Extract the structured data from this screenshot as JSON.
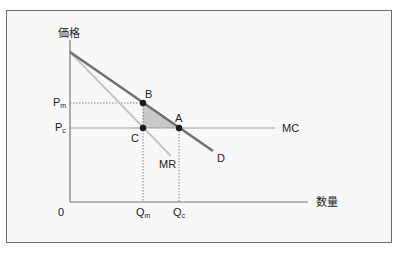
{
  "diagram": {
    "y_axis_label": "価格",
    "x_axis_label": "数量",
    "origin_label": "0",
    "price_labels": {
      "monopoly": {
        "main": "P",
        "sub": "m"
      },
      "competitive": {
        "main": "P",
        "sub": "c"
      }
    },
    "quantity_labels": {
      "monopoly": {
        "main": "Q",
        "sub": "m"
      },
      "competitive": {
        "main": "Q",
        "sub": "c"
      }
    },
    "curves": {
      "demand": "D",
      "marginal_revenue": "MR",
      "marginal_cost": "MC"
    },
    "points": {
      "A": "A",
      "B": "B",
      "C": "C"
    },
    "colors": {
      "demand": "#6e6e6e",
      "marginal_revenue": "#c4c4c4",
      "marginal_cost": "#9a9a9a",
      "axes": "#777777",
      "deadweight_fill": "#c9c9c9",
      "points": "#1a1a1a",
      "frame_border": "#6d6d6d",
      "background": "#f8f8f8"
    }
  }
}
